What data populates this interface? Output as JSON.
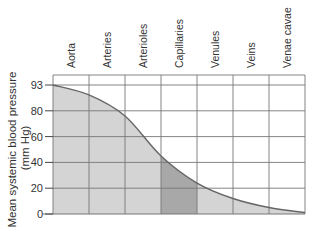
{
  "chart_data": {
    "type": "area",
    "title": "",
    "xlabel": "",
    "ylabel": "Mean systemic blood pressure (mm Hg)",
    "ylabel_lines": [
      "Mean systemic blood pressure",
      "(mm Hg)"
    ],
    "categories": [
      "Aorta",
      "Arteries",
      "Arterioles",
      "Capillaries",
      "Venules",
      "Veins",
      "Venae cavae"
    ],
    "y_ticks": [
      0,
      20,
      40,
      60,
      80,
      93
    ],
    "ylim": [
      0,
      93
    ],
    "grid": true,
    "legend": null,
    "highlighted_category": "Capillaries",
    "series": [
      {
        "name": "Mean systemic blood pressure",
        "x_boundaries": [
          0,
          1,
          2,
          3,
          4,
          5,
          6,
          7
        ],
        "values_at_boundaries": [
          93,
          88,
          76,
          45,
          24,
          12,
          5,
          1
        ]
      }
    ]
  },
  "colors": {
    "fill": "#d4d4d4",
    "fill_highlight": "#a8a8a8",
    "curve": "#666666",
    "grid": "#777777",
    "text": "#333333"
  }
}
